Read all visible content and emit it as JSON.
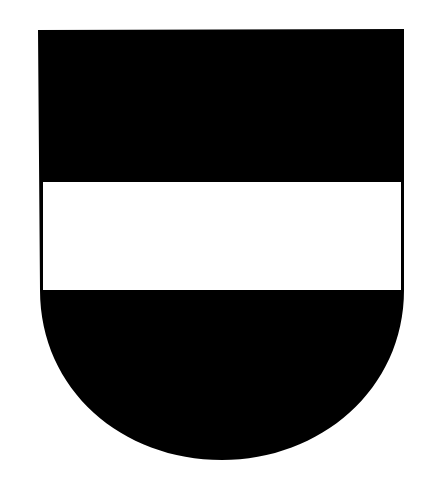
{
  "image": {
    "subject": "coat-of-arms-shield",
    "background_color": "#ffffff",
    "shield": {
      "field_color": "#000000",
      "fess_color": "#ffffff",
      "outline_color": "#000000",
      "left": 38,
      "right": 404,
      "top": 30,
      "fess_top": 182,
      "fess_bottom": 290,
      "base_bottom": 460
    }
  }
}
